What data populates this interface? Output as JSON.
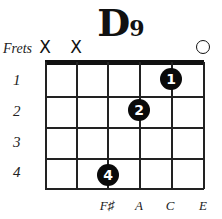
{
  "chord": {
    "name": "D",
    "suffix": "9"
  },
  "labels": {
    "frets": "Frets"
  },
  "string_markers": [
    {
      "string": 1,
      "symbol": "X",
      "type": "muted"
    },
    {
      "string": 2,
      "symbol": "X",
      "type": "muted"
    },
    {
      "string": 6,
      "symbol": "O",
      "type": "open"
    }
  ],
  "fret_numbers": [
    "1",
    "2",
    "3",
    "4"
  ],
  "fingers": [
    {
      "finger": "1",
      "string": 5,
      "fret": 1
    },
    {
      "finger": "2",
      "string": 4,
      "fret": 2
    },
    {
      "finger": "4",
      "string": 3,
      "fret": 4
    }
  ],
  "notes": [
    {
      "string": 3,
      "label": "F♯"
    },
    {
      "string": 4,
      "label": "A"
    },
    {
      "string": 5,
      "label": "C"
    },
    {
      "string": 6,
      "label": "E"
    }
  ],
  "colors": {
    "ink": "#111111",
    "background": "#ffffff"
  }
}
